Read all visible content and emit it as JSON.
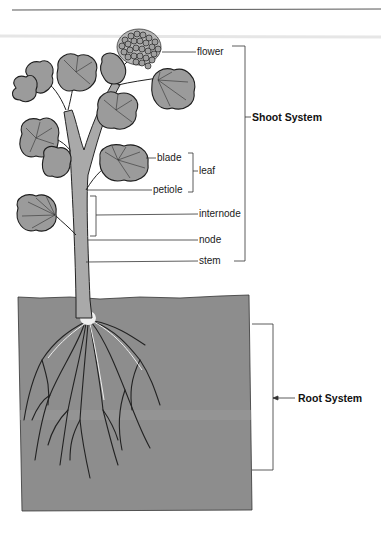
{
  "diagram": {
    "labels": {
      "flower": "flower",
      "blade": "blade",
      "leaf": "leaf",
      "petiole": "petiole",
      "internode": "internode",
      "node": "node",
      "stem": "stem"
    },
    "systems": {
      "shoot": "Shoot System",
      "root": "Root System"
    },
    "colors": {
      "leaf_fill": "#9a9a9a",
      "outline": "#1e1e1e",
      "soil": "#8c8c8c",
      "stem": "#a8a8a8",
      "root_highlight": "#f2f2f2"
    }
  }
}
